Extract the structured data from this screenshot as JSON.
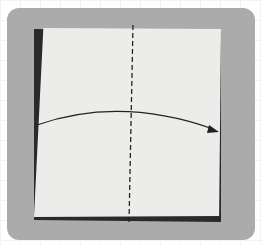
{
  "figure": {
    "colors": {
      "background": "#ffffff",
      "frame": "#ababab",
      "paper": "#ececea",
      "line": "#222222"
    },
    "fold_line": {
      "style": "dashed",
      "orientation": "vertical"
    },
    "arrow": {
      "direction": "left-to-right",
      "shape": "curved"
    }
  }
}
